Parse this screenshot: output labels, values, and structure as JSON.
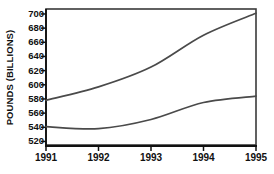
{
  "chart_data": {
    "type": "line",
    "title": "",
    "subtitle": "",
    "xlabel": "",
    "ylabel": "POUNDS (BILLIONS)",
    "categories": [
      "1991",
      "1992",
      "1993",
      "1994",
      "1995"
    ],
    "x": [
      1991,
      1992,
      1993,
      1994,
      1995
    ],
    "series": [
      {
        "name": "upper",
        "values": [
          578,
          597,
          625,
          670,
          701
        ],
        "color": "#4a4a4a"
      },
      {
        "name": "lower",
        "values": [
          541,
          538,
          551,
          575,
          584
        ],
        "color": "#4a4a4a"
      }
    ],
    "ylim": [
      515,
      707
    ],
    "xlim": [
      1991,
      1995
    ],
    "yticks": [
      700,
      680,
      660,
      640,
      620,
      600,
      580,
      560,
      540,
      520
    ],
    "ytick_labels": [
      "700",
      "680",
      "660",
      "640",
      "620",
      "600",
      "580",
      "560",
      "540",
      "520"
    ],
    "xticks": [
      1991,
      1992,
      1993,
      1994,
      1995
    ],
    "xtick_labels": [
      "1991",
      "1992",
      "1993",
      "1994",
      "1995"
    ],
    "grid": false,
    "legend": "none",
    "annotations": [],
    "plot_bg": "#ffffff",
    "frame_color": "#3a3a3a",
    "axis_color": "#111111",
    "page_bg": "#ffffff"
  }
}
